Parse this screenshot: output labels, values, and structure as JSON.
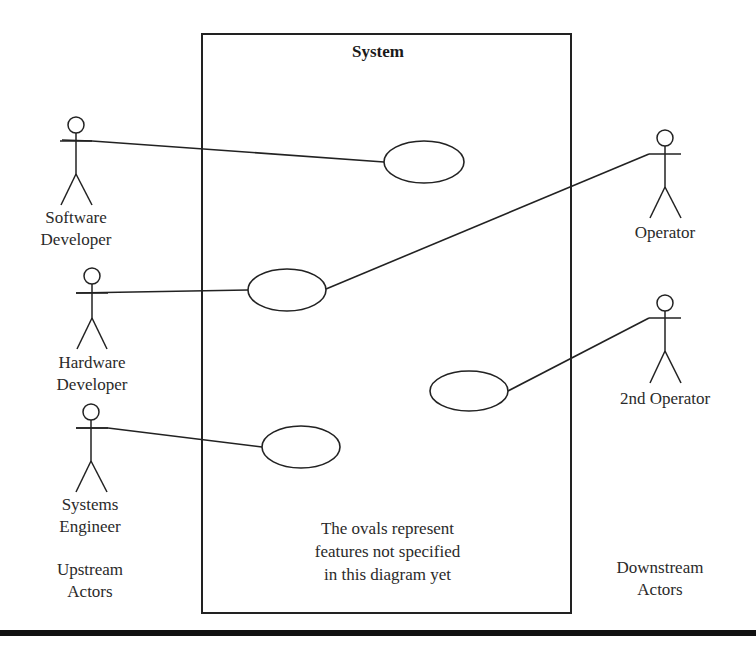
{
  "system": {
    "title": "System",
    "note": "The ovals represent\nfeatures not specified\nin this diagram yet"
  },
  "actors": {
    "upstream": [
      {
        "id": "software-developer",
        "label": "Software\nDeveloper"
      },
      {
        "id": "hardware-developer",
        "label": "Hardware\nDeveloper"
      },
      {
        "id": "systems-engineer",
        "label": "Systems\nEngineer"
      }
    ],
    "downstream": [
      {
        "id": "operator",
        "label": "Operator"
      },
      {
        "id": "2nd-operator",
        "label": "2nd Operator"
      }
    ]
  },
  "groups": {
    "upstream_label": "Upstream\nActors",
    "downstream_label": "Downstream\nActors"
  },
  "use_cases": [
    {
      "id": "oval-1",
      "connected_to": [
        "software-developer"
      ]
    },
    {
      "id": "oval-2",
      "connected_to": [
        "hardware-developer",
        "operator"
      ]
    },
    {
      "id": "oval-3",
      "connected_to": [
        "2nd-operator"
      ]
    },
    {
      "id": "oval-4",
      "connected_to": [
        "systems-engineer"
      ]
    }
  ],
  "colors": {
    "stroke": "#222222",
    "background": "#ffffff"
  }
}
